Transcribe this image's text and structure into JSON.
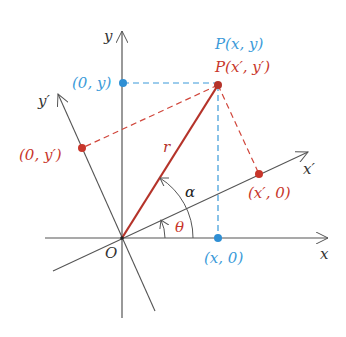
{
  "diagram": {
    "colors": {
      "axis": "#555555",
      "blue": "#3a9ad9",
      "red": "#c8362b",
      "radius": "#b5332a"
    },
    "axes": {
      "x_label": "x",
      "y_label": "y",
      "x_prime_label": "x′",
      "y_prime_label": "y′",
      "origin_label": "O"
    },
    "point": {
      "blue_label": "P(x, y)",
      "red_label": "P(x′, y′)"
    },
    "projections": {
      "x_on_x_axis": "(x, 0)",
      "y_on_y_axis": "(0, y)",
      "x_on_x_prime": "(x′, 0)",
      "y_on_y_prime": "(0, y′)"
    },
    "angles": {
      "theta": "θ",
      "alpha": "α"
    },
    "radius_label": "r"
  }
}
